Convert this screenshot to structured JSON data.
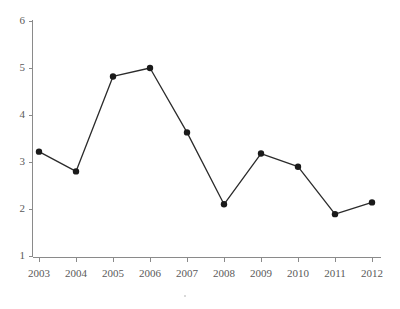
{
  "chart_data": {
    "type": "line",
    "title": "",
    "subtitle": "",
    "xlabel": "",
    "ylabel": "",
    "categories": [
      "2003",
      "2004",
      "2005",
      "2006",
      "2007",
      "2008",
      "2009",
      "2010",
      "2011",
      "2012"
    ],
    "values": [
      3.22,
      2.8,
      4.82,
      5.0,
      3.63,
      2.1,
      3.18,
      2.9,
      1.89,
      2.14
    ],
    "series": [
      {
        "name": "series-1",
        "values": [
          3.22,
          2.8,
          4.82,
          5.0,
          3.63,
          2.1,
          3.18,
          2.9,
          1.89,
          2.14
        ]
      }
    ],
    "ylim": [
      1,
      6
    ],
    "yticks": [
      1,
      2,
      3,
      4,
      5,
      6
    ],
    "ytick_labels": [
      "1",
      "2",
      "3",
      "4",
      "5",
      "6"
    ],
    "xtick_labels": [
      "2003",
      "2004",
      "2005",
      "2006",
      "2007",
      "2008",
      "2009",
      "2010",
      "2011",
      "2012"
    ],
    "grid": false,
    "legend": false,
    "legend_position": "none",
    "marker": "circle",
    "line_color": "#2b2b2b",
    "marker_color": "#1a1a1a",
    "axis_color": "#8a8a8a",
    "background_color": "#ffffff"
  },
  "axes": {
    "y_axis_name": "y-axis",
    "x_axis_name": "x-axis"
  }
}
